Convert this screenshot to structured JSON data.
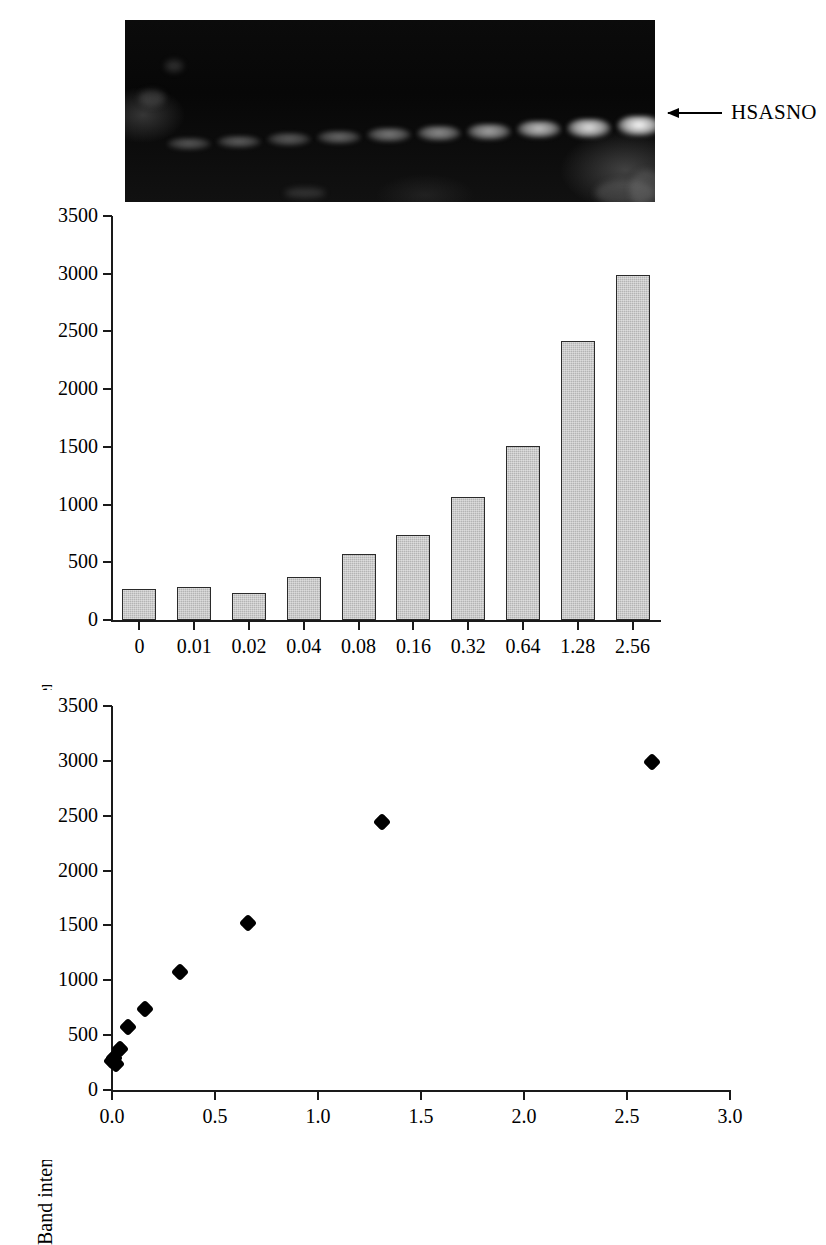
{
  "gel": {
    "name": "hsasno-gel-blot",
    "arrow_label": "HSASNO",
    "lanes": [
      {
        "label": "0",
        "brightness": 0.14
      },
      {
        "label": "0.01",
        "brightness": 0.18
      },
      {
        "label": "0.02",
        "brightness": 0.16
      },
      {
        "label": "0.04",
        "brightness": 0.24
      },
      {
        "label": "0.08",
        "brightness": 0.33
      },
      {
        "label": "0.16",
        "brightness": 0.42
      },
      {
        "label": "0.32",
        "brightness": 0.55
      },
      {
        "label": "0.64",
        "brightness": 0.7
      },
      {
        "label": "1.28",
        "brightness": 0.86
      },
      {
        "label": "2.56",
        "brightness": 1.0
      }
    ]
  },
  "chart_data": [
    {
      "type": "bar",
      "name": "band-intensity-bar-chart",
      "title": "",
      "xlabel": "pmoles SNO",
      "ylabel": "Band intensity (area units)",
      "categories": [
        "0",
        "0.01",
        "0.02",
        "0.04",
        "0.08",
        "0.16",
        "0.32",
        "0.64",
        "1.28",
        "2.56"
      ],
      "values": [
        265,
        290,
        235,
        375,
        575,
        740,
        1065,
        1510,
        2420,
        2985
      ],
      "yticks": [
        0,
        500,
        1000,
        1500,
        2000,
        2500,
        3000,
        3500
      ],
      "ylim": [
        0,
        3500
      ],
      "grid": false,
      "legend": false,
      "bar_color": "#b4b4b4",
      "bar_edge_color": "#2a2a2a"
    },
    {
      "type": "scatter",
      "name": "band-intensity-scatter-plot",
      "title": "",
      "xlabel": "pmoles SNO",
      "ylabel": "Band intensity (area units)",
      "x": [
        0,
        0.01,
        0.02,
        0.04,
        0.08,
        0.16,
        0.33,
        0.66,
        1.31,
        2.62
      ],
      "y": [
        265,
        290,
        235,
        375,
        575,
        740,
        1075,
        1520,
        2440,
        2990
      ],
      "xticks": [
        0.0,
        0.5,
        1.0,
        1.5,
        2.0,
        2.5,
        3.0
      ],
      "xtick_labels": [
        "0.0",
        "0.5",
        "1.0",
        "1.5",
        "2.0",
        "2.5",
        "3.0"
      ],
      "yticks": [
        0,
        500,
        1000,
        1500,
        2000,
        2500,
        3000,
        3500
      ],
      "ytick_labels": [
        "0",
        "500",
        "1000",
        "1500",
        "2000",
        "2500",
        "3000",
        "3500"
      ],
      "xlim": [
        0,
        3.0
      ],
      "ylim": [
        0,
        3500
      ],
      "grid": false,
      "legend": false,
      "marker_color": "#000000",
      "marker": "diamond"
    }
  ]
}
